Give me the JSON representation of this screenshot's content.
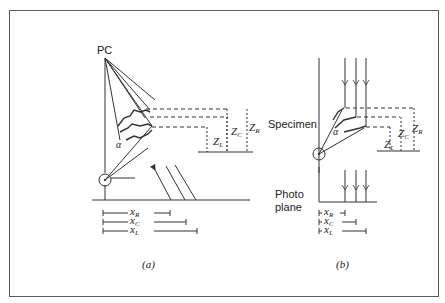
{
  "figure": {
    "panels": [
      {
        "id": "a",
        "caption": "(a)",
        "projection_center_label": "PC",
        "angle_label": "α",
        "heights": [
          {
            "symbol": "Z",
            "sub": "L"
          },
          {
            "symbol": "Z",
            "sub": "C"
          },
          {
            "symbol": "Z",
            "sub": "R"
          }
        ],
        "distances": [
          {
            "symbol": "x",
            "sub": "R"
          },
          {
            "symbol": "x",
            "sub": "C"
          },
          {
            "symbol": "x",
            "sub": "L"
          }
        ]
      },
      {
        "id": "b",
        "caption": "(b)",
        "angle_label": "α",
        "heights": [
          {
            "symbol": "Z",
            "sub": "L"
          },
          {
            "symbol": "Z",
            "sub": "C"
          },
          {
            "symbol": "Z",
            "sub": "R"
          }
        ],
        "distances": [
          {
            "symbol": "x",
            "sub": "R"
          },
          {
            "symbol": "x",
            "sub": "C"
          },
          {
            "symbol": "x",
            "sub": "L"
          }
        ]
      }
    ],
    "labels": {
      "specimen": "Specimen",
      "photo_line1": "Photo",
      "photo_line2": "plane"
    }
  }
}
